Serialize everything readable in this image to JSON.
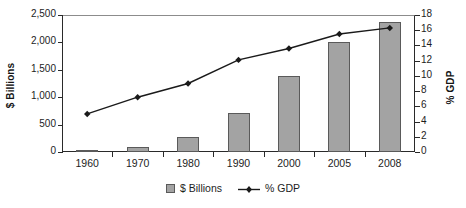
{
  "chart_data": {
    "type": "bar",
    "title": "",
    "subtitle": "",
    "xlabel": "",
    "ylabel": "$ Billions",
    "y2label": "% GDP",
    "categories": [
      "1960",
      "1970",
      "1980",
      "1990",
      "2000",
      "2005",
      "2008"
    ],
    "series": [
      {
        "name": "$ Billions",
        "type": "bar",
        "axis": "left",
        "color": "#a3a3a3",
        "border_color": "#5a5a5a",
        "values": [
          25,
          100,
          280,
          720,
          1390,
          2000,
          2370
        ]
      },
      {
        "name": "% GDP",
        "type": "line",
        "axis": "right",
        "color": "#1a1a1a",
        "marker": "diamond",
        "values": [
          5.0,
          7.2,
          9.0,
          12.1,
          13.6,
          15.5,
          16.3
        ]
      }
    ],
    "ylim": [
      0,
      2500
    ],
    "yticks": [
      0,
      500,
      1000,
      1500,
      2000,
      2500
    ],
    "ytick_labels": [
      "0",
      "500",
      "1,000",
      "1,500",
      "2,000",
      "2,500"
    ],
    "y2lim": [
      0,
      18
    ],
    "y2ticks": [
      0,
      2,
      4,
      6,
      8,
      10,
      12,
      14,
      16,
      18
    ],
    "y2tick_labels": [
      "0",
      "2",
      "4",
      "6",
      "8",
      "10",
      "12",
      "14",
      "16",
      "18"
    ],
    "grid": false,
    "legend_position": "bottom"
  },
  "legend": {
    "bar_label": "$ Billions",
    "line_label": "% GDP"
  },
  "colors": {
    "bar_fill": "#a3a3a3",
    "bar_stroke": "#5a5a5a",
    "line": "#1a1a1a",
    "axis": "#2a2a2a",
    "background": "#ffffff"
  }
}
